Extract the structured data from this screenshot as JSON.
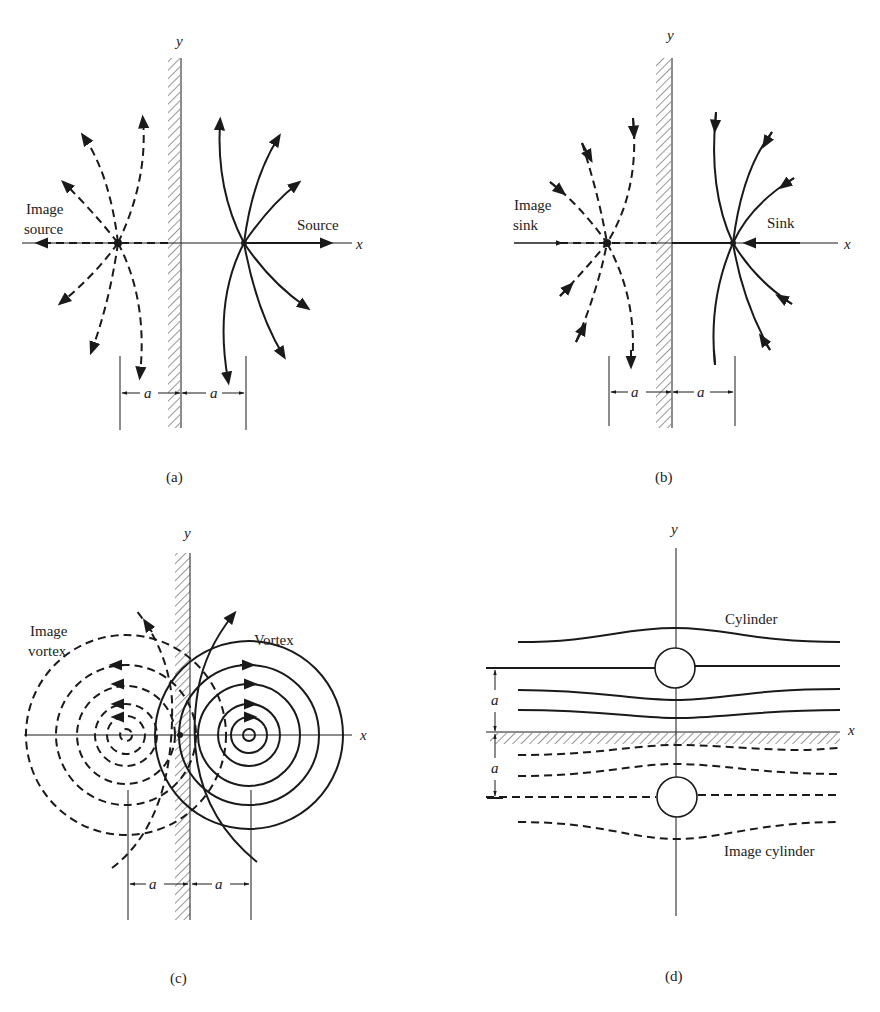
{
  "figure": {
    "panels": [
      {
        "id": "a",
        "caption": "(a)",
        "axis_x": "x",
        "axis_y": "y",
        "real_label": "Source",
        "image_label_line1": "Image",
        "image_label_line2": "source",
        "dimension_left": "a",
        "dimension_right": "a",
        "wall": "vertical plane wall along y-axis"
      },
      {
        "id": "b",
        "caption": "(b)",
        "axis_x": "x",
        "axis_y": "y",
        "real_label": "Sink",
        "image_label_line1": "Image",
        "image_label_line2": "sink",
        "dimension_left": "a",
        "dimension_right": "a",
        "wall": "vertical plane wall along y-axis"
      },
      {
        "id": "c",
        "caption": "(c)",
        "axis_x": "x",
        "axis_y": "y",
        "real_label": "Vortex",
        "image_label_line1": "Image",
        "image_label_line2": "vortex",
        "dimension_left": "a",
        "dimension_right": "a",
        "wall": "vertical plane wall along y-axis"
      },
      {
        "id": "d",
        "caption": "(d)",
        "axis_x": "x",
        "axis_y": "y",
        "real_label": "Cylinder",
        "image_label": "Image cylinder",
        "dimension_upper": "a",
        "dimension_lower": "a",
        "wall": "horizontal plane wall along x-axis"
      }
    ]
  }
}
